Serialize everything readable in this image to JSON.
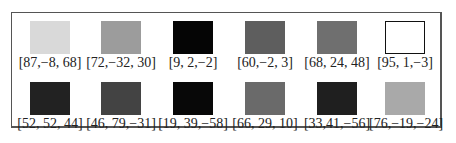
{
  "swatches": [
    {
      "label": "[87,−8, 68]",
      "color": "#d9d9d9",
      "outlined": false
    },
    {
      "label": "[72,−32, 30]",
      "color": "#9c9c9c",
      "outlined": false
    },
    {
      "label": "[9, 2,−2]",
      "color": "#050505",
      "outlined": false
    },
    {
      "label": "[60,−2, 3]",
      "color": "#5e5e5e",
      "outlined": false
    },
    {
      "label": "[68, 24, 48]",
      "color": "#6f6f6f",
      "outlined": false
    },
    {
      "label": "[95, 1,−3]",
      "color": "#ffffff",
      "outlined": true
    },
    {
      "label": "[52, 52, 44]",
      "color": "#222222",
      "outlined": false
    },
    {
      "label": "[46, 79,−31]",
      "color": "#434343",
      "outlined": false
    },
    {
      "label": "[19, 39,−58]",
      "color": "#080808",
      "outlined": false
    },
    {
      "label": "[66, 29, 10]",
      "color": "#6a6a6a",
      "outlined": false
    },
    {
      "label": "[33,41,−56]",
      "color": "#1f1f1f",
      "outlined": false
    },
    {
      "label": "[76,−19,−24]",
      "color": "#a9a9a9",
      "outlined": false
    }
  ]
}
